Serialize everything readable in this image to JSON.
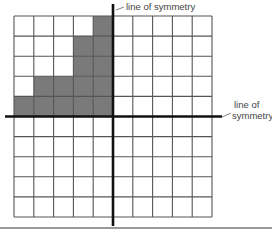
{
  "diagram": {
    "type": "grid-symmetry",
    "grid": {
      "columns": 10,
      "rows": 10
    },
    "shaded_cells": [
      {
        "col": 5,
        "row": 1
      },
      {
        "col": 4,
        "row": 2
      },
      {
        "col": 5,
        "row": 2
      },
      {
        "col": 4,
        "row": 3
      },
      {
        "col": 5,
        "row": 3
      },
      {
        "col": 2,
        "row": 4
      },
      {
        "col": 3,
        "row": 4
      },
      {
        "col": 4,
        "row": 4
      },
      {
        "col": 5,
        "row": 4
      },
      {
        "col": 1,
        "row": 5
      },
      {
        "col": 2,
        "row": 5
      },
      {
        "col": 3,
        "row": 5
      },
      {
        "col": 4,
        "row": 5
      },
      {
        "col": 5,
        "row": 5
      }
    ],
    "axes": {
      "vertical_after_column": 5,
      "horizontal_after_row": 5
    },
    "labels": {
      "vertical_axis": "line of symmetry",
      "horizontal_axis_line1": "line of",
      "horizontal_axis_line2": "symmetry"
    },
    "colors": {
      "shade": "#7a7a7a",
      "grid_line": "#555555",
      "axis": "#111111"
    }
  }
}
